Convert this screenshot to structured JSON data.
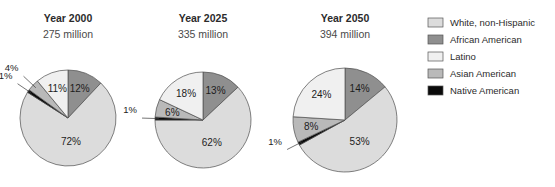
{
  "chart_data": {
    "type": "pie",
    "title": "",
    "legend_position": "right",
    "legend": [
      {
        "label": "White, non-Hispanic",
        "color": "#dcdcdc"
      },
      {
        "label": "African American",
        "color": "#8f8f8f"
      },
      {
        "label": "Latino",
        "color": "#f0f0f0"
      },
      {
        "label": "Asian American",
        "color": "#b9b9b9"
      },
      {
        "label": "Native American",
        "color": "#0a0a0a"
      }
    ],
    "categories": [
      "White, non-Hispanic",
      "African American",
      "Latino",
      "Asian American",
      "Native American"
    ],
    "charts": [
      {
        "title": "Year 2000",
        "subtitle": "275 million",
        "center_x": 68,
        "center_y": 118,
        "radius": 48,
        "values": [
          72,
          12,
          11,
          4,
          1
        ],
        "slices": [
          {
            "name": "African American",
            "value": 12,
            "label": "12%",
            "color": "#8f8f8f",
            "inside": true
          },
          {
            "name": "White, non-Hispanic",
            "value": 72,
            "label": "72%",
            "color": "#dcdcdc",
            "inside": true
          },
          {
            "name": "Native American",
            "value": 1,
            "label": "1%",
            "color": "#0a0a0a",
            "inside": false
          },
          {
            "name": "Asian American",
            "value": 4,
            "label": "4%",
            "color": "#b9b9b9",
            "inside": false
          },
          {
            "name": "Latino",
            "value": 11,
            "label": "11%",
            "color": "#f0f0f0",
            "inside": true
          }
        ]
      },
      {
        "title": "Year 2025",
        "subtitle": "335 million",
        "center_x": 203,
        "center_y": 120,
        "radius": 48,
        "values": [
          62,
          13,
          18,
          6,
          1
        ],
        "slices": [
          {
            "name": "African American",
            "value": 13,
            "label": "13%",
            "color": "#8f8f8f",
            "inside": true
          },
          {
            "name": "White, non-Hispanic",
            "value": 62,
            "label": "62%",
            "color": "#dcdcdc",
            "inside": true
          },
          {
            "name": "Native American",
            "value": 1,
            "label": "1%",
            "color": "#0a0a0a",
            "inside": false
          },
          {
            "name": "Asian American",
            "value": 6,
            "label": "6%",
            "color": "#b9b9b9",
            "inside": true
          },
          {
            "name": "Latino",
            "value": 18,
            "label": "18%",
            "color": "#f0f0f0",
            "inside": true
          }
        ]
      },
      {
        "title": "Year 2050",
        "subtitle": "394 million",
        "center_x": 345,
        "center_y": 120,
        "radius": 52,
        "values": [
          53,
          14,
          24,
          8,
          1
        ],
        "slices": [
          {
            "name": "African American",
            "value": 14,
            "label": "14%",
            "color": "#8f8f8f",
            "inside": true
          },
          {
            "name": "White, non-Hispanic",
            "value": 53,
            "label": "53%",
            "color": "#dcdcdc",
            "inside": true
          },
          {
            "name": "Native American",
            "value": 1,
            "label": "1%",
            "color": "#0a0a0a",
            "inside": false
          },
          {
            "name": "Asian American",
            "value": 8,
            "label": "8%",
            "color": "#b9b9b9",
            "inside": true
          },
          {
            "name": "Latino",
            "value": 24,
            "label": "24%",
            "color": "#f0f0f0",
            "inside": true
          }
        ]
      }
    ]
  },
  "legend_geometry": {
    "x": 428,
    "y_start": 18,
    "row_height": 17,
    "swatch_width": 15,
    "swatch_height": 9,
    "text_offset": 22
  }
}
